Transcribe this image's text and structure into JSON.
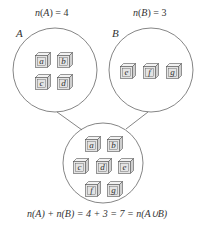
{
  "diagram": {
    "title_left": {
      "fn": "n",
      "arg": "A",
      "eq": " = 4"
    },
    "title_right": {
      "fn": "n",
      "arg": "B",
      "eq": " = 3"
    },
    "set_a": {
      "label": "A",
      "elements": [
        "a",
        "b",
        "c",
        "d"
      ]
    },
    "set_b": {
      "label": "B",
      "elements": [
        "e",
        "f",
        "g"
      ]
    },
    "union": {
      "elements": [
        "a",
        "b",
        "c",
        "d",
        "e",
        "f",
        "g"
      ]
    },
    "equation": "n(A) + n(B) = 4 + 3 = 7 = n(A∪B)",
    "colors": {
      "stroke": "#555555",
      "cube_face": "#e4e4e4",
      "cube_side": "#cfcfcf",
      "cube_top": "#f2f2f2",
      "text": "#333333"
    }
  }
}
